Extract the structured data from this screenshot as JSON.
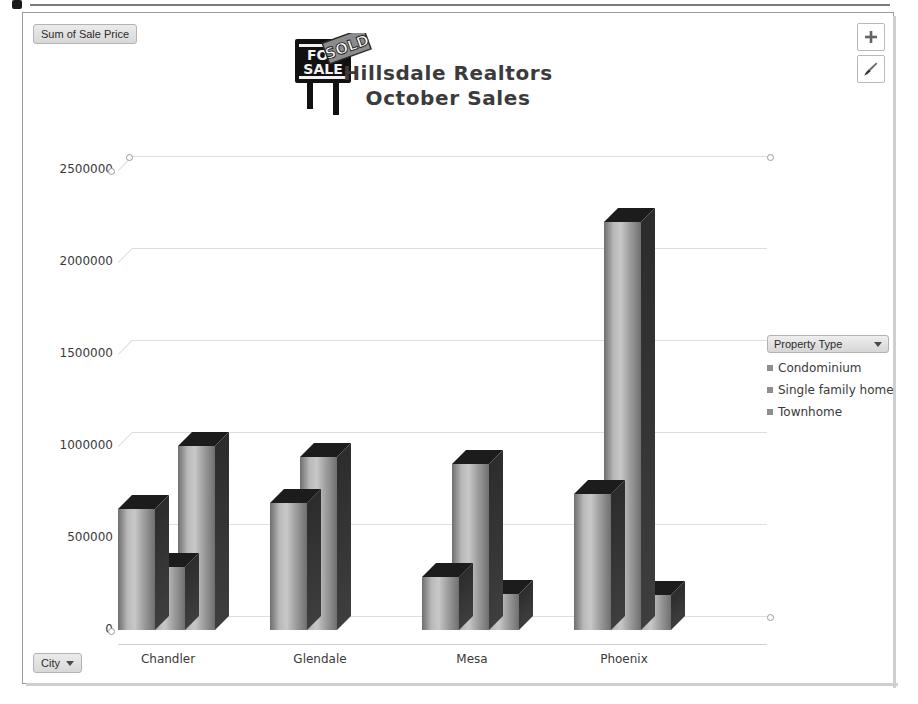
{
  "window": {
    "top_rule_present": true
  },
  "chart_object": {
    "value_field_button": {
      "label": "Sum of Sale Price"
    },
    "category_field_button": {
      "label": "City",
      "caret": "chevron-down-icon"
    },
    "side_buttons": [
      {
        "name": "chart-elements-button",
        "icon": "plus-icon",
        "glyph": "+"
      },
      {
        "name": "chart-styles-button",
        "icon": "paintbrush-icon",
        "glyph": "brush"
      }
    ]
  },
  "legend": {
    "header_label": "Property Type",
    "caret": "chevron-down-icon",
    "items": [
      {
        "label": "Condominium",
        "color": "#8e8e8e"
      },
      {
        "label": "Single family home",
        "color": "#8e8e8e"
      },
      {
        "label": "Townhome",
        "color": "#8e8e8e"
      }
    ]
  },
  "chart_data": {
    "type": "bar",
    "title": "Hillsdale Realtors\nOctober Sales",
    "title_line1": "Hillsdale Realtors",
    "title_line2": "October Sales",
    "xlabel": "",
    "ylabel": "Sum of Sale Price",
    "categories": [
      "Chandler",
      "Glendale",
      "Mesa",
      "Phoenix"
    ],
    "series": [
      {
        "name": "Condominium",
        "values": [
          660000,
          690000,
          290000,
          740000
        ]
      },
      {
        "name": "Single family home",
        "values": [
          340000,
          940000,
          900000,
          2220000
        ]
      },
      {
        "name": "Townhome",
        "values": [
          1000000,
          null,
          195000,
          190000
        ]
      }
    ],
    "ylim": [
      0,
      2500000
    ],
    "yticks": [
      0,
      500000,
      1000000,
      1500000,
      2000000,
      2500000
    ],
    "ytick_labels": [
      "0",
      "500000",
      "1000000",
      "1500000",
      "2000000",
      "2500000"
    ],
    "grid": true,
    "three_d": true,
    "legend_position": "right",
    "bar_fill": "#b9b9b9",
    "bar_side": "#333333",
    "bar_top": "#1c1c1c"
  }
}
